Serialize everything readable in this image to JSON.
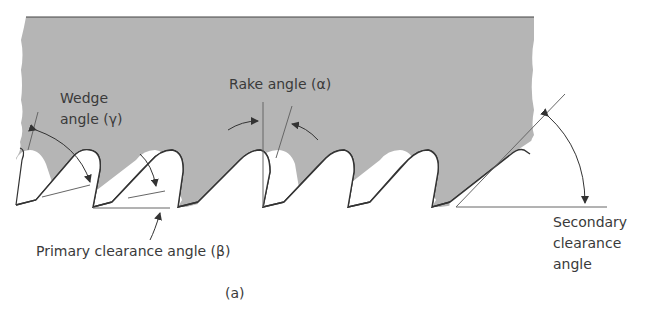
{
  "figure": {
    "caption": "(a)",
    "colors": {
      "blade": "#b5b5b5",
      "outline": "#3a3a3a",
      "lines": "#666666",
      "text": "#3a3a3a"
    }
  },
  "labels": {
    "wedge_line1": "Wedge",
    "wedge_line2": "angle (γ)",
    "rake": "Rake angle (α)",
    "primary": "Primary clearance angle (β)",
    "secondary_line1": "Secondary",
    "secondary_line2": "clearance",
    "secondary_line3": "angle"
  }
}
